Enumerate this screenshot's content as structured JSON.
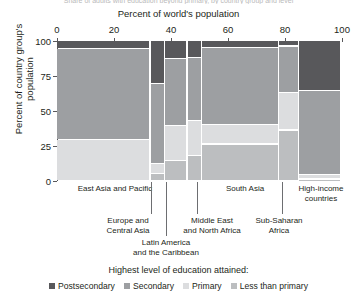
{
  "cut_title": "Share of adults with education beyond primary, by country group and level",
  "axes": {
    "x_title": "Percent of world's population",
    "x_ticks": [
      0,
      20,
      40,
      60,
      80,
      100
    ],
    "x_range": [
      0,
      100
    ],
    "y_title": "Percent of country group's population",
    "y_ticks": [
      0,
      25,
      50,
      75,
      100
    ],
    "y_range": [
      0,
      100
    ]
  },
  "legend": {
    "title": "Highest level of education attained:",
    "items": [
      {
        "label": "Postsecondary",
        "color": "#58585b"
      },
      {
        "label": "Secondary",
        "color": "#9d9fa2"
      },
      {
        "label": "Primary",
        "color": "#dcdddf"
      },
      {
        "label": "Less than primary",
        "color": "#bcbec0"
      }
    ]
  },
  "chart_data": {
    "type": "bar",
    "subtype": "marimekko",
    "title": "Percent of world's population",
    "xlabel": "Percent of world's population",
    "ylabel": "Percent of country group's population",
    "xlim": [
      0,
      100
    ],
    "ylim": [
      0,
      100
    ],
    "grid": false,
    "legend_position": "bottom",
    "categories": [
      "East Asia and Pacific",
      "Europe and Central Asia",
      "Latin America and the Caribbean",
      "Middle East and North Africa",
      "South Asia",
      "Sub-Saharan Africa",
      "High-income countries"
    ],
    "category_widths": [
      33,
      5,
      8,
      5,
      27,
      7,
      15
    ],
    "series": [
      {
        "name": "Postsecondary",
        "color": "#58585b",
        "values": [
          6,
          31,
          13,
          12,
          5,
          4,
          36
        ]
      },
      {
        "name": "Secondary",
        "color": "#9d9fa2",
        "values": [
          65,
          57,
          48,
          45,
          55,
          33,
          60
        ]
      },
      {
        "name": "Primary",
        "color": "#dcdddf",
        "values": [
          29,
          7,
          25,
          25,
          14,
          27,
          3
        ]
      },
      {
        "name": "Less than primary",
        "color": "#bcbec0",
        "values": [
          0,
          5,
          14,
          18,
          26,
          36,
          1
        ]
      }
    ]
  },
  "columns": [
    {
      "name": "East Asia and Pacific",
      "label_lines": [
        "East Asia and Pacific"
      ],
      "x0": 0,
      "x1": 33,
      "segments": [
        {
          "level": "Postsecondary",
          "value": 6
        },
        {
          "level": "Secondary",
          "value": 65
        },
        {
          "level": "Primary",
          "value": 29
        },
        {
          "level": "Less than primary",
          "value": 0
        }
      ]
    },
    {
      "name": "Europe and Central Asia",
      "label_lines": [
        "Europe and",
        "Central Asia"
      ],
      "x0": 33,
      "x1": 38,
      "segments": [
        {
          "level": "Postsecondary",
          "value": 31
        },
        {
          "level": "Secondary",
          "value": 57
        },
        {
          "level": "Primary",
          "value": 7
        },
        {
          "level": "Less than primary",
          "value": 5
        }
      ]
    },
    {
      "name": "Latin America and the Caribbean",
      "label_lines": [
        "Latin America",
        "and the Caribbean"
      ],
      "x0": 38,
      "x1": 46,
      "segments": [
        {
          "level": "Postsecondary",
          "value": 13
        },
        {
          "level": "Secondary",
          "value": 48
        },
        {
          "level": "Primary",
          "value": 25
        },
        {
          "level": "Less than primary",
          "value": 14
        }
      ]
    },
    {
      "name": "Middle East and North Africa",
      "label_lines": [
        "Middle East",
        "and North Africa"
      ],
      "x0": 46,
      "x1": 51,
      "segments": [
        {
          "level": "Postsecondary",
          "value": 12
        },
        {
          "level": "Secondary",
          "value": 45
        },
        {
          "level": "Primary",
          "value": 25
        },
        {
          "level": "Less than primary",
          "value": 18
        }
      ]
    },
    {
      "name": "South Asia",
      "label_lines": [
        "South Asia"
      ],
      "x0": 51,
      "x1": 78,
      "segments": [
        {
          "level": "Postsecondary",
          "value": 5
        },
        {
          "level": "Secondary",
          "value": 55
        },
        {
          "level": "Primary",
          "value": 14
        },
        {
          "level": "Less than primary",
          "value": 26
        }
      ]
    },
    {
      "name": "Sub-Saharan Africa",
      "label_lines": [
        "Sub-Saharan",
        "Africa"
      ],
      "x0": 78,
      "x1": 85,
      "segments": [
        {
          "level": "Postsecondary",
          "value": 4
        },
        {
          "level": "Secondary",
          "value": 33
        },
        {
          "level": "Primary",
          "value": 27
        },
        {
          "level": "Less than primary",
          "value": 36
        }
      ]
    },
    {
      "name": "High-income countries",
      "label_lines": [
        "High-income",
        "countries"
      ],
      "x0": 85,
      "x1": 100,
      "segments": [
        {
          "level": "Postsecondary",
          "value": 36
        },
        {
          "level": "Secondary",
          "value": 60
        },
        {
          "level": "Primary",
          "value": 3
        },
        {
          "level": "Less than primary",
          "value": 1
        }
      ]
    }
  ],
  "category_annotations": [
    {
      "key": "east-asia-and-pacific",
      "lines": [
        "East Asia and Pacific"
      ],
      "left": 60,
      "top": 184,
      "width": 110,
      "align": "center",
      "leader": null
    },
    {
      "key": "europe-and-central-asia",
      "lines": [
        "Europe and",
        "Central Asia"
      ],
      "left": 92,
      "top": 216,
      "width": 72,
      "align": "center",
      "leader": {
        "x": 151,
        "y": 182,
        "h": 32
      }
    },
    {
      "key": "latin-america",
      "lines": [
        "Latin America",
        "and the Caribbean"
      ],
      "left": 122,
      "top": 238,
      "width": 88,
      "align": "center",
      "leader": {
        "x": 166,
        "y": 182,
        "h": 54
      }
    },
    {
      "key": "middle-east-north-africa",
      "lines": [
        "Middle East",
        "and North Africa"
      ],
      "left": 170,
      "top": 216,
      "width": 84,
      "align": "center",
      "leader": {
        "x": 197,
        "y": 182,
        "h": 32
      }
    },
    {
      "key": "south-asia",
      "lines": [
        "South Asia"
      ],
      "left": 205,
      "top": 184,
      "width": 80,
      "align": "center",
      "leader": null
    },
    {
      "key": "sub-saharan-africa",
      "lines": [
        "Sub-Saharan",
        "Africa"
      ],
      "left": 244,
      "top": 216,
      "width": 70,
      "align": "center",
      "leader": {
        "x": 282,
        "y": 182,
        "h": 32
      }
    },
    {
      "key": "high-income-countries",
      "lines": [
        "High-income",
        "countries"
      ],
      "left": 288,
      "top": 184,
      "width": 66,
      "align": "center",
      "leader": null
    }
  ]
}
